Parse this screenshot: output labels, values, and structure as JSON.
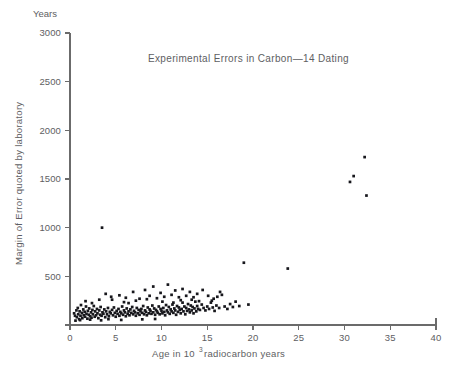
{
  "chart_data": {
    "type": "scatter",
    "title": "Experimental Errors in Carbon—14  Dating",
    "xlabel": "Age in 10",
    "xlabel_exponent": "3",
    "xlabel_tail": " radiocarbon years",
    "ylabel": "Margin of Error quoted by laboratory",
    "y_units_label": "Years",
    "xlim": [
      0,
      40
    ],
    "ylim": [
      0,
      3000
    ],
    "xticks": [
      0,
      5,
      10,
      15,
      20,
      25,
      30,
      35,
      40
    ],
    "yticks": [
      0,
      500,
      1000,
      1500,
      2000,
      2500,
      3000
    ],
    "xtick_labels": [
      "0",
      "5",
      "10",
      "15",
      "20",
      "25",
      "30",
      "35",
      "40"
    ],
    "ytick_labels": [
      "0",
      "500",
      "1000",
      "1500",
      "2000",
      "2500",
      "3000"
    ],
    "grid": false,
    "legend": "none",
    "marker_color": "#17171c",
    "axis_color": "#6b6b6b",
    "text_color": "#5e5e62",
    "background_color": "#ffffff",
    "point_count": 212,
    "points": [
      [
        0.45,
        120
      ],
      [
        0.55,
        95
      ],
      [
        0.7,
        150
      ],
      [
        0.75,
        80
      ],
      [
        0.85,
        175
      ],
      [
        0.9,
        110
      ],
      [
        1.0,
        60
      ],
      [
        1.05,
        140
      ],
      [
        1.15,
        95
      ],
      [
        1.2,
        205
      ],
      [
        1.3,
        125
      ],
      [
        1.35,
        70
      ],
      [
        1.45,
        160
      ],
      [
        1.5,
        100
      ],
      [
        1.6,
        135
      ],
      [
        1.65,
        85
      ],
      [
        1.75,
        190
      ],
      [
        1.8,
        115
      ],
      [
        1.9,
        65
      ],
      [
        1.95,
        145
      ],
      [
        2.05,
        105
      ],
      [
        2.1,
        170
      ],
      [
        2.2,
        90
      ],
      [
        2.3,
        130
      ],
      [
        2.35,
        75
      ],
      [
        2.45,
        155
      ],
      [
        2.5,
        110
      ],
      [
        2.6,
        195
      ],
      [
        2.7,
        85
      ],
      [
        2.75,
        140
      ],
      [
        2.85,
        100
      ],
      [
        2.95,
        165
      ],
      [
        3.0,
        120
      ],
      [
        3.1,
        70
      ],
      [
        3.2,
        150
      ],
      [
        3.3,
        105
      ],
      [
        3.35,
        185
      ],
      [
        3.45,
        95
      ],
      [
        3.5,
        1000
      ],
      [
        3.55,
        130
      ],
      [
        3.65,
        115
      ],
      [
        3.75,
        160
      ],
      [
        3.85,
        80
      ],
      [
        3.95,
        140
      ],
      [
        4.05,
        110
      ],
      [
        4.15,
        175
      ],
      [
        4.25,
        90
      ],
      [
        4.35,
        135
      ],
      [
        4.45,
        120
      ],
      [
        4.5,
        290
      ],
      [
        4.6,
        155
      ],
      [
        4.7,
        100
      ],
      [
        4.8,
        180
      ],
      [
        4.9,
        125
      ],
      [
        5.0,
        85
      ],
      [
        5.1,
        145
      ],
      [
        5.2,
        115
      ],
      [
        5.3,
        165
      ],
      [
        5.4,
        95
      ],
      [
        5.5,
        135
      ],
      [
        5.6,
        120
      ],
      [
        5.7,
        190
      ],
      [
        5.8,
        105
      ],
      [
        5.9,
        150
      ],
      [
        6.0,
        130
      ],
      [
        6.1,
        90
      ],
      [
        6.2,
        170
      ],
      [
        6.3,
        115
      ],
      [
        6.4,
        140
      ],
      [
        6.5,
        100
      ],
      [
        6.6,
        160
      ],
      [
        6.7,
        125
      ],
      [
        6.8,
        185
      ],
      [
        6.9,
        110
      ],
      [
        7.0,
        145
      ],
      [
        7.1,
        130
      ],
      [
        7.2,
        95
      ],
      [
        7.3,
        175
      ],
      [
        7.4,
        120
      ],
      [
        7.5,
        155
      ],
      [
        7.6,
        105
      ],
      [
        7.7,
        140
      ],
      [
        7.8,
        165
      ],
      [
        7.9,
        125
      ],
      [
        8.0,
        195
      ],
      [
        8.1,
        110
      ],
      [
        8.2,
        150
      ],
      [
        8.3,
        135
      ],
      [
        8.4,
        100
      ],
      [
        8.5,
        180
      ],
      [
        8.6,
        120
      ],
      [
        8.7,
        160
      ],
      [
        8.8,
        145
      ],
      [
        8.9,
        115
      ],
      [
        9.0,
        200
      ],
      [
        9.1,
        130
      ],
      [
        9.2,
        170
      ],
      [
        9.3,
        105
      ],
      [
        9.4,
        155
      ],
      [
        9.5,
        140
      ],
      [
        9.6,
        125
      ],
      [
        9.7,
        190
      ],
      [
        9.8,
        110
      ],
      [
        9.9,
        165
      ],
      [
        10.0,
        145
      ],
      [
        10.1,
        120
      ],
      [
        10.2,
        175
      ],
      [
        10.3,
        135
      ],
      [
        10.4,
        100
      ],
      [
        10.5,
        205
      ],
      [
        10.6,
        150
      ],
      [
        10.7,
        130
      ],
      [
        10.8,
        185
      ],
      [
        10.9,
        115
      ],
      [
        11.0,
        160
      ],
      [
        11.1,
        140
      ],
      [
        11.2,
        210
      ],
      [
        11.3,
        125
      ],
      [
        11.4,
        170
      ],
      [
        11.5,
        150
      ],
      [
        11.6,
        105
      ],
      [
        11.7,
        195
      ],
      [
        11.8,
        135
      ],
      [
        11.9,
        180
      ],
      [
        12.0,
        155
      ],
      [
        12.1,
        120
      ],
      [
        12.2,
        165
      ],
      [
        12.3,
        230
      ],
      [
        12.4,
        140
      ],
      [
        12.5,
        190
      ],
      [
        12.6,
        110
      ],
      [
        12.7,
        175
      ],
      [
        12.8,
        145
      ],
      [
        12.9,
        215
      ],
      [
        13.0,
        160
      ],
      [
        13.1,
        130
      ],
      [
        13.2,
        200
      ],
      [
        13.3,
        150
      ],
      [
        13.4,
        185
      ],
      [
        13.5,
        120
      ],
      [
        13.6,
        170
      ],
      [
        13.7,
        240
      ],
      [
        13.8,
        140
      ],
      [
        13.9,
        195
      ],
      [
        14.0,
        165
      ],
      [
        14.2,
        155
      ],
      [
        14.4,
        210
      ],
      [
        14.6,
        175
      ],
      [
        14.8,
        150
      ],
      [
        15.0,
        190
      ],
      [
        15.2,
        165
      ],
      [
        15.4,
        230
      ],
      [
        15.6,
        180
      ],
      [
        15.8,
        145
      ],
      [
        16.0,
        200
      ],
      [
        16.3,
        175
      ],
      [
        16.6,
        310
      ],
      [
        16.9,
        190
      ],
      [
        17.2,
        165
      ],
      [
        17.5,
        215
      ],
      [
        17.8,
        185
      ],
      [
        18.1,
        240
      ],
      [
        18.5,
        195
      ],
      [
        19.0,
        640
      ],
      [
        19.5,
        210
      ],
      [
        3.9,
        320
      ],
      [
        4.6,
        260
      ],
      [
        5.4,
        305
      ],
      [
        6.1,
        280
      ],
      [
        6.9,
        340
      ],
      [
        7.6,
        270
      ],
      [
        8.2,
        360
      ],
      [
        8.7,
        300
      ],
      [
        9.1,
        395
      ],
      [
        9.5,
        275
      ],
      [
        9.9,
        330
      ],
      [
        10.3,
        290
      ],
      [
        10.7,
        415
      ],
      [
        11.1,
        310
      ],
      [
        11.5,
        355
      ],
      [
        11.9,
        285
      ],
      [
        12.3,
        370
      ],
      [
        12.7,
        300
      ],
      [
        13.1,
        340
      ],
      [
        13.5,
        285
      ],
      [
        13.9,
        320
      ],
      [
        14.5,
        360
      ],
      [
        15.1,
        300
      ],
      [
        15.7,
        270
      ],
      [
        16.4,
        340
      ],
      [
        1.7,
        245
      ],
      [
        2.4,
        225
      ],
      [
        3.2,
        260
      ],
      [
        5.9,
        235
      ],
      [
        7.2,
        250
      ],
      [
        8.4,
        265
      ],
      [
        10.1,
        240
      ],
      [
        12.1,
        255
      ],
      [
        14.1,
        245
      ],
      [
        16.1,
        290
      ],
      [
        23.8,
        580
      ],
      [
        30.6,
        1470
      ],
      [
        31.0,
        1530
      ],
      [
        32.2,
        1725
      ],
      [
        32.4,
        1330
      ],
      [
        6.4,
        225
      ],
      [
        11.3,
        230
      ],
      [
        0.6,
        45
      ],
      [
        1.1,
        50
      ],
      [
        2.2,
        55
      ],
      [
        3.4,
        48
      ],
      [
        4.2,
        60
      ],
      [
        5.6,
        52
      ],
      [
        7.9,
        58
      ],
      [
        9.3,
        62
      ],
      [
        13.3,
        260
      ],
      [
        15.5,
        250
      ]
    ]
  }
}
